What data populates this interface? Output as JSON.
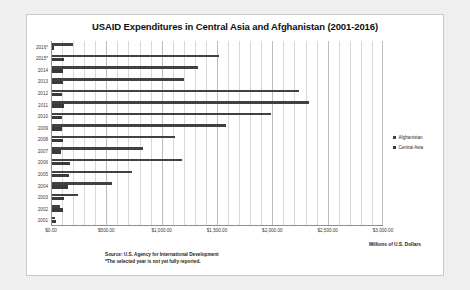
{
  "chart_data": {
    "type": "bar",
    "orientation": "horizontal",
    "title": "USAID Expenditures in Central Asia and Afghanistan (2001-2016)",
    "xlabel": "Millions of U.S. Dollars",
    "ylabel": "",
    "xlim": [
      0,
      3000
    ],
    "grid": true,
    "legend_position": "right",
    "categories": [
      "2016*",
      "2015*",
      "2014",
      "2013",
      "2012",
      "2011",
      "2010",
      "2009",
      "2008",
      "2007",
      "2006",
      "2005",
      "2004",
      "2003",
      "2002",
      "2001"
    ],
    "series": [
      {
        "name": "Afghanistan",
        "color": "#414141",
        "values": [
          200,
          1520,
          1330,
          1200,
          2240,
          2330,
          1990,
          1580,
          1120,
          830,
          1180,
          730,
          550,
          240,
          80,
          40
        ]
      },
      {
        "name": "Central Asia",
        "color": "#3a3a3a",
        "values": [
          25,
          115,
          110,
          105,
          100,
          120,
          95,
          100,
          110,
          90,
          170,
          165,
          155,
          115,
          110,
          45
        ]
      }
    ],
    "xticks": [
      {
        "value": 0,
        "label": "$0.00"
      },
      {
        "value": 500,
        "label": "$500.00"
      },
      {
        "value": 1000,
        "label": "$1,000.00"
      },
      {
        "value": 1500,
        "label": "$1,500.00"
      },
      {
        "value": 2000,
        "label": "$2,000.00"
      },
      {
        "value": 2500,
        "label": "$2,500.00"
      },
      {
        "value": 3000,
        "label": "$3,000.00"
      }
    ],
    "minor_gridline_step": 100,
    "annotations": [
      "Source: U.S. Agency for International Development",
      "*The selected year is not yet fully reported."
    ]
  },
  "legend": {
    "items": [
      {
        "label": "Afghanistan"
      },
      {
        "label": "Central Asia"
      }
    ]
  },
  "notes": {
    "source": "Source: U.S. Agency for International Development",
    "footnote": "*The selected year is not yet fully reported."
  },
  "axis_caption": "Millions of U.S. Dollars"
}
